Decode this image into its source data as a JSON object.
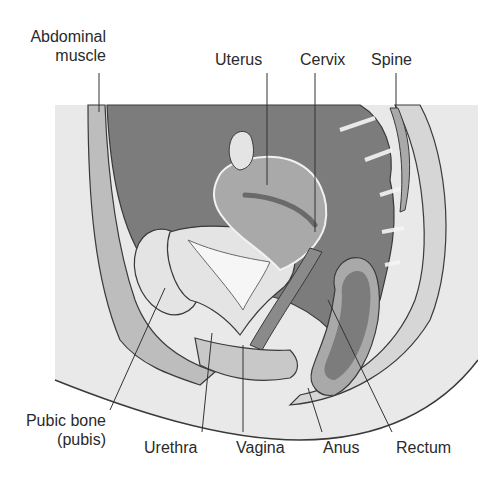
{
  "diagram": {
    "type": "anatomical-cross-section",
    "colors": {
      "background": "#ffffff",
      "skin": "#e9e9e9",
      "tissue_light": "#d6d6d6",
      "tissue_mid": "#bdbdbd",
      "cavity_dark": "#7c7c7c",
      "organ_mid": "#a9a9a9",
      "outline": "#3a3a3a",
      "leader": "#333333",
      "text": "#2a2a2a"
    },
    "labels": {
      "abdominal_muscle_line1": "Abdominal",
      "abdominal_muscle_line2": "muscle",
      "uterus": "Uterus",
      "cervix": "Cervix",
      "spine": "Spine",
      "pubic_bone_line1": "Pubic bone",
      "pubic_bone_line2": "(pubis)",
      "urethra": "Urethra",
      "vagina": "Vagina",
      "anus": "Anus",
      "rectum": "Rectum"
    }
  }
}
